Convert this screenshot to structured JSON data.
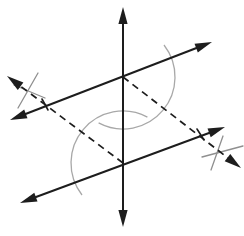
{
  "figure": {
    "kind": "geometry-construction-diagram",
    "width": 244,
    "height": 236,
    "background": "#ffffff",
    "colors": {
      "ink": "#1d1d1d",
      "construction": "#a8a8a8",
      "mark": "#8f8f8f"
    },
    "stroke_width_main": 2,
    "stroke_width_dashed": 1.7,
    "stroke_width_construction": 1.3,
    "dash_pattern": "7 5",
    "arrow": {
      "length": 17,
      "half_width": 4.6
    },
    "intersections": {
      "upper": {
        "x": 123,
        "y": 77
      },
      "lower": {
        "x": 123,
        "y": 163
      }
    },
    "lines": [
      {
        "name": "vertical-transversal-line",
        "x1": 123,
        "y1": 227,
        "x2": 123,
        "y2": 7,
        "dashed": false,
        "arrow_start": true,
        "arrow_end": true
      },
      {
        "name": "upper-parallel-line",
        "x1": 10,
        "y1": 120,
        "x2": 212,
        "y2": 42,
        "dashed": false,
        "arrow_start": true,
        "arrow_end": true
      },
      {
        "name": "lower-parallel-line",
        "x1": 20,
        "y1": 203,
        "x2": 225,
        "y2": 127,
        "dashed": false,
        "arrow_start": true,
        "arrow_end": true
      },
      {
        "name": "dashed-ray-upper-left",
        "x1": 123,
        "y1": 163,
        "x2": 7,
        "y2": 76,
        "dashed": true,
        "arrow_start": false,
        "arrow_end": true
      },
      {
        "name": "dashed-ray-lower-right",
        "x1": 123,
        "y1": 77,
        "x2": 241,
        "y2": 168,
        "dashed": true,
        "arrow_start": false,
        "arrow_end": true
      }
    ],
    "arcs": [
      {
        "name": "compass-arc-upper-intersection",
        "cx": 123,
        "cy": 77,
        "r": 52,
        "start_deg": -38,
        "end_deg": 118
      },
      {
        "name": "compass-arc-lower-intersection",
        "cx": 123,
        "cy": 163,
        "r": 52,
        "start_deg": 142,
        "end_deg": 298
      }
    ],
    "tick_marks": [
      {
        "name": "arc-cross-mark-left-steep",
        "x1": 18,
        "y1": 108,
        "x2": 38,
        "y2": 73,
        "color": "mark",
        "width": 1.3
      },
      {
        "name": "arc-cross-mark-left-shallow",
        "x1": 14,
        "y1": 85,
        "x2": 45,
        "y2": 98,
        "color": "mark",
        "width": 1.3
      },
      {
        "name": "arc-cross-mark-right-steep",
        "x1": 211,
        "y1": 170,
        "x2": 223,
        "y2": 136,
        "color": "mark",
        "width": 1.3
      },
      {
        "name": "arc-cross-mark-right-shallow",
        "x1": 202,
        "y1": 157,
        "x2": 243,
        "y2": 146,
        "color": "mark",
        "width": 1.3
      },
      {
        "name": "compass-tick-on-upper-line",
        "x1": 42,
        "y1": 99,
        "x2": 48,
        "y2": 110,
        "color": "ink",
        "width": 1.6
      },
      {
        "name": "compass-tick-on-lower-line",
        "x1": 197,
        "y1": 129,
        "x2": 204,
        "y2": 140,
        "color": "ink",
        "width": 1.6
      }
    ]
  }
}
